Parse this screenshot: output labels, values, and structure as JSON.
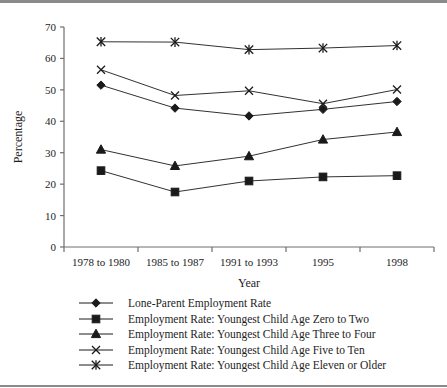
{
  "chart_data": {
    "type": "line",
    "title": "",
    "xlabel": "Year",
    "ylabel": "Percentage",
    "categories": [
      "1978 to 1980",
      "1985 to 1987",
      "1991 to 1993",
      "1995",
      "1998"
    ],
    "ylim": [
      0,
      70
    ],
    "yticks": [
      0,
      10,
      20,
      30,
      40,
      50,
      60,
      70
    ],
    "grid": false,
    "legend_position": "bottom",
    "series": [
      {
        "name": "Lone-Parent Employment Rate",
        "marker": "diamond",
        "color": "#1a1a1a",
        "values": [
          51.5,
          44.2,
          41.7,
          43.8,
          46.3
        ]
      },
      {
        "name": "Employment Rate: Youngest Child Age Zero to Two",
        "marker": "square",
        "color": "#1a1a1a",
        "values": [
          24.3,
          17.5,
          21.0,
          22.3,
          22.7
        ]
      },
      {
        "name": "Employment Rate: Youngest Child Age Three to Four",
        "marker": "triangle",
        "color": "#1a1a1a",
        "values": [
          31.0,
          25.8,
          28.9,
          34.2,
          36.6
        ]
      },
      {
        "name": "Employment Rate: Youngest Child Age Five to Ten",
        "marker": "cross",
        "color": "#1a1a1a",
        "values": [
          56.4,
          48.2,
          49.7,
          45.6,
          50.1
        ]
      },
      {
        "name": "Employment Rate: Youngest Child Age Eleven or Older",
        "marker": "asterisk",
        "color": "#1a1a1a",
        "values": [
          65.3,
          65.2,
          62.8,
          63.3,
          64.1
        ]
      }
    ]
  },
  "axes": {
    "y_title": "Percentage",
    "x_title": "Year",
    "y_tick_labels": [
      "70",
      "60",
      "50",
      "40",
      "30",
      "20",
      "10",
      "0"
    ],
    "x_tick_labels": [
      "1978 to 1980",
      "1985 to 1987",
      "1991 to 1993",
      "1995",
      "1998"
    ]
  },
  "legend": {
    "items": [
      {
        "label": "Lone-Parent Employment Rate",
        "marker": "diamond"
      },
      {
        "label": "Employment Rate: Youngest Child Age Zero to Two",
        "marker": "square"
      },
      {
        "label": "Employment Rate: Youngest Child Age Three to Four",
        "marker": "triangle"
      },
      {
        "label": "Employment Rate: Youngest Child Age Five to Ten",
        "marker": "cross"
      },
      {
        "label": "Employment Rate: Youngest Child Age Eleven or Older",
        "marker": "asterisk"
      }
    ]
  }
}
